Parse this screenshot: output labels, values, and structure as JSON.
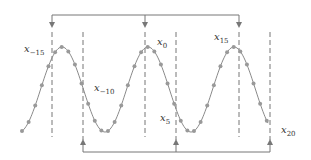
{
  "diagram": {
    "colors": {
      "curve": "#8a8a8a",
      "points": "#999999",
      "dashes": "#777777",
      "arrows": "#777777",
      "text": "#333333"
    },
    "labels": [
      {
        "id": "x-15",
        "base": "x",
        "sub": "−15",
        "x": 24,
        "y": 44
      },
      {
        "id": "x-10",
        "base": "x",
        "sub": "−10",
        "x": 94,
        "y": 83
      },
      {
        "id": "x0",
        "base": "x",
        "sub": "0",
        "x": 157,
        "y": 37
      },
      {
        "id": "x5",
        "base": "x",
        "sub": "5",
        "x": 160,
        "y": 113
      },
      {
        "id": "x15",
        "base": "x",
        "sub": "15",
        "x": 214,
        "y": 32
      },
      {
        "id": "x20",
        "base": "x",
        "sub": "20",
        "x": 281,
        "y": 125
      }
    ],
    "top_bracket": {
      "y": 15,
      "x_start": 52,
      "x_end": 239,
      "arrows_down_at": [
        52,
        145,
        239
      ]
    },
    "bottom_bracket": {
      "y": 152,
      "x_start": 83,
      "x_end": 270,
      "arrows_up_at": [
        83,
        176,
        270
      ]
    },
    "dashed_lines": [
      {
        "x": 52,
        "y1": 32,
        "y2": 137
      },
      {
        "x": 83,
        "y1": 32,
        "y2": 140
      },
      {
        "x": 145,
        "y1": 32,
        "y2": 137
      },
      {
        "x": 176,
        "y1": 32,
        "y2": 140
      },
      {
        "x": 239,
        "y1": 32,
        "y2": 137
      },
      {
        "x": 270,
        "y1": 32,
        "y2": 140
      }
    ],
    "wave": {
      "x_start": 22,
      "x_end": 268,
      "period": 86,
      "peak_y": 47,
      "trough_y": 132,
      "first_peak_x": 62,
      "samples_per_period": 13
    }
  }
}
